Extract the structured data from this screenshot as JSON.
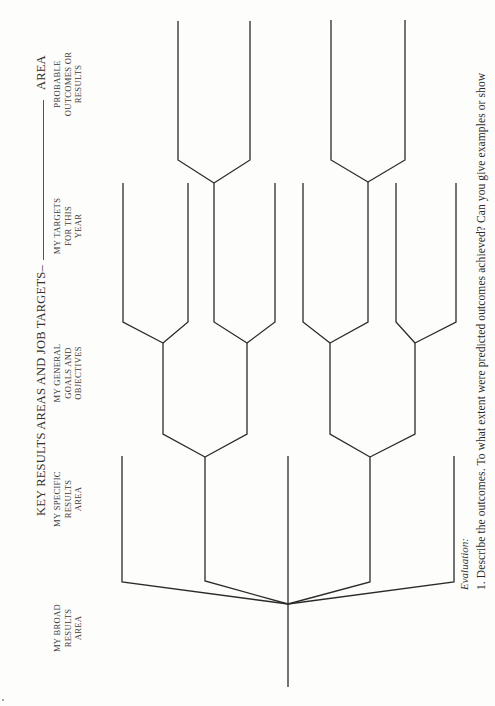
{
  "document": {
    "orientation": "rotated-90-ccw",
    "header": {
      "title": "KEY RESULTS AREAS AND JOB TARGETS–",
      "blank_suffix": "AREA"
    },
    "columns": [
      {
        "id": "broad",
        "lines": [
          "MY BROAD",
          "RESULTS",
          "AREA"
        ]
      },
      {
        "id": "specific",
        "lines": [
          "MY SPECIFIC",
          "RESULTS",
          "AREA"
        ]
      },
      {
        "id": "general",
        "lines": [
          "MY GENERAL",
          "GOALS AND",
          "OBJECTIVES"
        ]
      },
      {
        "id": "targets",
        "lines": [
          "MY TARGETS",
          "FOR THIS",
          "YEAR"
        ]
      },
      {
        "id": "outcomes",
        "lines": [
          "PROBABLE",
          "OUTCOMES OR",
          "RESULTS"
        ]
      }
    ],
    "evaluation": {
      "heading": "Evaluation:",
      "items": [
        "1.  Describe the outcomes. To what extent were predicted outcomes achieved? Can you give examples or show"
      ]
    }
  },
  "tree": {
    "stroke": "#2b2b2b",
    "root": {
      "x": 288,
      "y_bottom": 687,
      "y_junction": 604
    },
    "segments": [
      [
        [
          288,
          687
        ],
        [
          288,
          604
        ]
      ],
      [
        [
          288,
          604
        ],
        [
          122,
          582
        ],
        [
          122,
          456
        ]
      ],
      [
        [
          288,
          604
        ],
        [
          205,
          581
        ],
        [
          205,
          457
        ]
      ],
      [
        [
          288,
          604
        ],
        [
          288,
          456
        ]
      ],
      [
        [
          288,
          604
        ],
        [
          370,
          582
        ],
        [
          370,
          457
        ]
      ],
      [
        [
          288,
          604
        ],
        [
          454,
          582
        ],
        [
          454,
          456
        ]
      ],
      [
        [
          205,
          457
        ],
        [
          163,
          434
        ],
        [
          163,
          343
        ]
      ],
      [
        [
          205,
          457
        ],
        [
          247,
          434
        ],
        [
          247,
          343
        ]
      ],
      [
        [
          370,
          457
        ],
        [
          330,
          434
        ],
        [
          330,
          343
        ]
      ],
      [
        [
          370,
          457
        ],
        [
          415,
          434
        ],
        [
          415,
          343
        ]
      ],
      [
        [
          163,
          343
        ],
        [
          123,
          322
        ],
        [
          123,
          183
        ]
      ],
      [
        [
          163,
          343
        ],
        [
          188,
          322
        ],
        [
          188,
          183
        ]
      ],
      [
        [
          247,
          343
        ],
        [
          214,
          322
        ],
        [
          214,
          183
        ]
      ],
      [
        [
          247,
          343
        ],
        [
          275,
          322
        ],
        [
          275,
          183
        ]
      ],
      [
        [
          330,
          343
        ],
        [
          303,
          322
        ],
        [
          303,
          183
        ]
      ],
      [
        [
          330,
          343
        ],
        [
          368,
          322
        ],
        [
          368,
          182
        ]
      ],
      [
        [
          415,
          343
        ],
        [
          396,
          322
        ],
        [
          396,
          183
        ]
      ],
      [
        [
          415,
          343
        ],
        [
          456,
          322
        ],
        [
          456,
          183
        ]
      ],
      [
        [
          214,
          183
        ],
        [
          178,
          160
        ],
        [
          178,
          21
        ]
      ],
      [
        [
          214,
          183
        ],
        [
          250,
          160
        ],
        [
          250,
          21
        ]
      ],
      [
        [
          368,
          182
        ],
        [
          331,
          160
        ],
        [
          331,
          20
        ]
      ],
      [
        [
          368,
          182
        ],
        [
          405,
          160
        ],
        [
          405,
          20
        ]
      ]
    ]
  }
}
